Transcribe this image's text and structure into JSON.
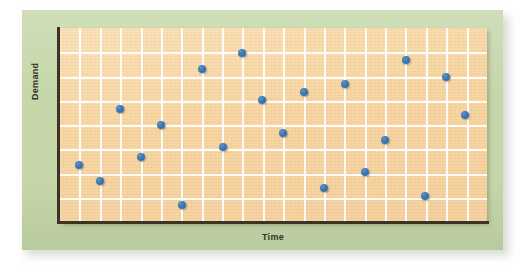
{
  "figure": {
    "panel_color": "#c5d7a9",
    "plot_background": "#f7d9a9",
    "grid_color": "#ffffff",
    "axis_color": "#3a3326",
    "marker_color": "#3a78b4"
  },
  "chart_data": {
    "type": "scatter",
    "title": "",
    "subtitle": "",
    "xlabel": "Time",
    "ylabel": "Demand",
    "grid": true,
    "legend": null,
    "xlim": [
      0,
      20
    ],
    "ylim": [
      0,
      7
    ],
    "x_tick_labels": [],
    "y_tick_labels": [],
    "x_gridlines": 20,
    "y_gridlines": 7,
    "annotations": [],
    "series": [
      {
        "name": "Demand observations",
        "marker": "circle",
        "color": "#3a78b4",
        "points": [
          {
            "x": 0.9,
            "y": 2.05,
            "px": 79,
            "py": 165
          },
          {
            "x": 1.9,
            "y": 1.48,
            "px": 100,
            "py": 181
          },
          {
            "x": 2.9,
            "y": 4.07,
            "px": 120,
            "py": 109
          },
          {
            "x": 3.9,
            "y": 2.42,
            "px": 141,
            "py": 157
          },
          {
            "x": 4.9,
            "y": 3.49,
            "px": 161,
            "py": 125
          },
          {
            "x": 5.9,
            "y": 0.6,
            "px": 182,
            "py": 205
          },
          {
            "x": 6.9,
            "y": 5.47,
            "px": 202,
            "py": 69
          },
          {
            "x": 7.9,
            "y": 2.65,
            "px": 223,
            "py": 147
          },
          {
            "x": 8.9,
            "y": 6.05,
            "px": 242,
            "py": 53
          },
          {
            "x": 9.9,
            "y": 4.61,
            "px": 262,
            "py": 100
          },
          {
            "x": 10.9,
            "y": 3.41,
            "px": 283,
            "py": 133
          },
          {
            "x": 11.9,
            "y": 4.77,
            "px": 304,
            "py": 92
          },
          {
            "x": 12.9,
            "y": 1.29,
            "px": 324,
            "py": 188
          },
          {
            "x": 13.9,
            "y": 5.03,
            "px": 345,
            "py": 84
          },
          {
            "x": 14.9,
            "y": 1.9,
            "px": 365,
            "py": 172
          },
          {
            "x": 15.9,
            "y": 3.05,
            "px": 385,
            "py": 140
          },
          {
            "x": 16.9,
            "y": 5.77,
            "px": 406,
            "py": 60
          },
          {
            "x": 17.9,
            "y": 0.98,
            "px": 425,
            "py": 196
          },
          {
            "x": 18.9,
            "y": 5.3,
            "px": 446,
            "py": 77
          },
          {
            "x": 19.9,
            "y": 3.9,
            "px": 465,
            "py": 115
          }
        ]
      }
    ]
  }
}
